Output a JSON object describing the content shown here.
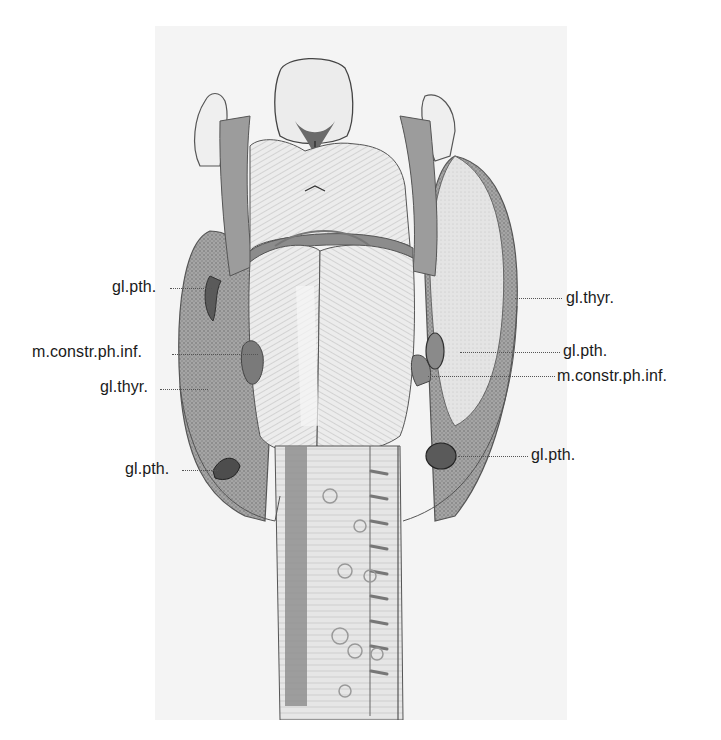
{
  "figure": {
    "labels_left": [
      {
        "text": "gl.pth.",
        "x": 112,
        "y": 278,
        "leader_x1": 170,
        "leader_x2": 212,
        "leader_y": 288
      },
      {
        "text": "m.constr.ph.inf.",
        "x": 32,
        "y": 343,
        "leader_x1": 172,
        "leader_x2": 258,
        "leader_y": 354
      },
      {
        "text": "gl.thyr.",
        "x": 100,
        "y": 378,
        "leader_x1": 160,
        "leader_x2": 208,
        "leader_y": 389
      },
      {
        "text": "gl.pth.",
        "x": 125,
        "y": 460,
        "leader_x1": 182,
        "leader_x2": 218,
        "leader_y": 470
      }
    ],
    "labels_right": [
      {
        "text": "gl.thyr.",
        "x": 566,
        "y": 289,
        "leader_x1": 515,
        "leader_x2": 562,
        "leader_y": 298
      },
      {
        "text": "gl.pth.",
        "x": 563,
        "y": 342,
        "leader_x1": 460,
        "leader_x2": 560,
        "leader_y": 352
      },
      {
        "text": "m.constr.ph.inf.",
        "x": 557,
        "y": 367,
        "leader_x1": 428,
        "leader_x2": 555,
        "leader_y": 376
      },
      {
        "text": "gl.pth.",
        "x": 531,
        "y": 446,
        "leader_x1": 458,
        "leader_x2": 528,
        "leader_y": 456
      }
    ],
    "colors": {
      "plate_bg": "#f4f4f4",
      "ink": "#3a3a3a",
      "tissue_dark": "#8a8a8a",
      "tissue_mid": "#b4b4b4",
      "tissue_light": "#dedede",
      "label_text": "#1a1a1a"
    }
  }
}
